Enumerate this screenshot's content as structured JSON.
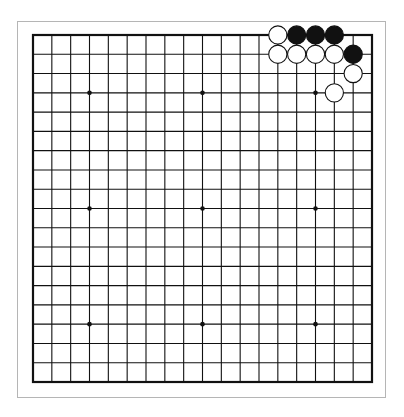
{
  "board": {
    "size": 19,
    "origin_x": 33,
    "origin_y": 35,
    "width": 339,
    "height": 347,
    "line_color": "#111111",
    "background": "#ffffff",
    "star_points": [
      [
        3,
        3
      ],
      [
        9,
        3
      ],
      [
        15,
        3
      ],
      [
        3,
        9
      ],
      [
        9,
        9
      ],
      [
        15,
        9
      ],
      [
        3,
        15
      ],
      [
        9,
        15
      ],
      [
        15,
        15
      ]
    ]
  },
  "stones": [
    {
      "color": "white",
      "col": 13,
      "row": 0
    },
    {
      "color": "black",
      "col": 14,
      "row": 0
    },
    {
      "color": "black",
      "col": 15,
      "row": 0
    },
    {
      "color": "black",
      "col": 16,
      "row": 0
    },
    {
      "color": "white",
      "col": 13,
      "row": 1
    },
    {
      "color": "white",
      "col": 14,
      "row": 1
    },
    {
      "color": "white",
      "col": 15,
      "row": 1
    },
    {
      "color": "white",
      "col": 16,
      "row": 1
    },
    {
      "color": "black",
      "col": 17,
      "row": 1
    },
    {
      "color": "white",
      "col": 17,
      "row": 2
    },
    {
      "color": "white",
      "col": 16,
      "row": 3
    }
  ]
}
